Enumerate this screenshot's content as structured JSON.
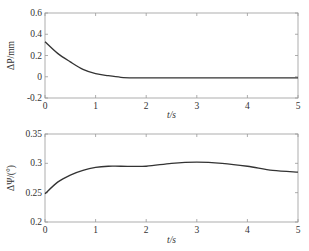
{
  "chart_data": [
    {
      "type": "line",
      "title": "",
      "xlabel": "t/s",
      "ylabel": "ΔP/mm",
      "xlim": [
        0,
        5
      ],
      "ylim": [
        -0.2,
        0.6
      ],
      "xticks": [
        "0",
        "1",
        "2",
        "3",
        "4",
        "5"
      ],
      "yticks": [
        "-0.2",
        "0",
        "0.2",
        "0.4",
        "0.6"
      ],
      "grid": false,
      "series": [
        {
          "name": "ΔP",
          "x": [
            0,
            0.25,
            0.5,
            0.75,
            1.0,
            1.25,
            1.5,
            1.75,
            2.0,
            2.5,
            3.0,
            3.5,
            4.0,
            4.5,
            5.0
          ],
          "y": [
            0.33,
            0.22,
            0.14,
            0.07,
            0.03,
            0.01,
            -0.005,
            -0.01,
            -0.01,
            -0.01,
            -0.01,
            -0.01,
            -0.01,
            -0.01,
            -0.01
          ]
        }
      ]
    },
    {
      "type": "line",
      "title": "",
      "xlabel": "t/s",
      "ylabel": "ΔΨ/(°)",
      "xlim": [
        0,
        5
      ],
      "ylim": [
        0.2,
        0.35
      ],
      "xticks": [
        "0",
        "1",
        "2",
        "3",
        "4",
        "5"
      ],
      "yticks": [
        "0.2",
        "0.25",
        "0.3",
        "0.35"
      ],
      "grid": false,
      "series": [
        {
          "name": "ΔΨ",
          "x": [
            0,
            0.25,
            0.5,
            0.75,
            1.0,
            1.25,
            1.5,
            2.0,
            2.5,
            3.0,
            3.5,
            4.0,
            4.5,
            5.0
          ],
          "y": [
            0.248,
            0.268,
            0.28,
            0.288,
            0.293,
            0.295,
            0.295,
            0.295,
            0.3,
            0.302,
            0.3,
            0.295,
            0.288,
            0.285
          ]
        }
      ]
    }
  ]
}
